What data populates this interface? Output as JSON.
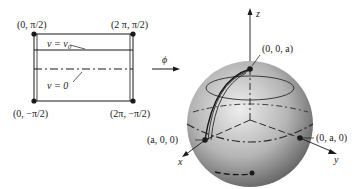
{
  "diagram": {
    "type": "mapping from parameter rectangle to sphere",
    "map_label": "ϕ",
    "rectangle": {
      "corners": {
        "top_left": "(0, π/2)",
        "top_right": "(2 π, π/2)",
        "bottom_left": "(0, −π/2)",
        "bottom_right": "(2π, −π/2)"
      },
      "lines": {
        "v0_label": "v = v",
        "v0_sub": "0",
        "zero_label": "v = 0"
      }
    },
    "sphere": {
      "axes": {
        "z": "z",
        "x": "x",
        "y": "y"
      },
      "points": {
        "north_pole": "(0, 0, a)",
        "x_point": "(a, 0, 0)",
        "y_point": "(0, a, 0)"
      }
    }
  },
  "colors": {
    "ink": "#1a1a1a",
    "sphere_light": "#e6e6e6",
    "sphere_dark": "#5a5a5a"
  }
}
